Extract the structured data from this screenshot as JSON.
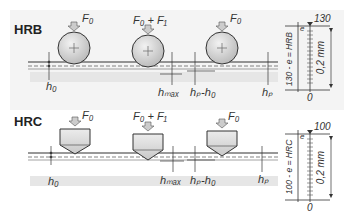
{
  "figure": {
    "type": "rockwell-hardness-test-diagram",
    "panels": [
      {
        "id": "hrb",
        "title": "HRB",
        "indenter": "ball",
        "stages": [
          {
            "force_label": "F₀"
          },
          {
            "force_label": "F₀ + F₁"
          },
          {
            "force_label": "F₀"
          }
        ],
        "dimension_labels": [
          "h₀",
          "hₘₐₓ",
          "hₚ-h₀",
          "hₚ"
        ],
        "scale": {
          "top_value": "130",
          "bottom_value": "0",
          "formula": "130 - e = HRB",
          "e_label": "e",
          "range_label": "0,2 mm"
        }
      },
      {
        "id": "hrc",
        "title": "HRC",
        "indenter": "cone",
        "stages": [
          {
            "force_label": "F₀"
          },
          {
            "force_label": "F₀ + F₁"
          },
          {
            "force_label": "F₀"
          }
        ],
        "dimension_labels": [
          "h₀",
          "hₘₐₓ",
          "hₚ-h₀",
          "hₚ"
        ],
        "scale": {
          "top_value": "100",
          "bottom_value": "0",
          "formula": "100 - e = HRC",
          "e_label": "e",
          "range_label": "0,2 mm"
        }
      }
    ],
    "colors": {
      "background": "#f4f4f4",
      "line": "#333333",
      "indenter_fill": "#d8d8d8"
    }
  }
}
